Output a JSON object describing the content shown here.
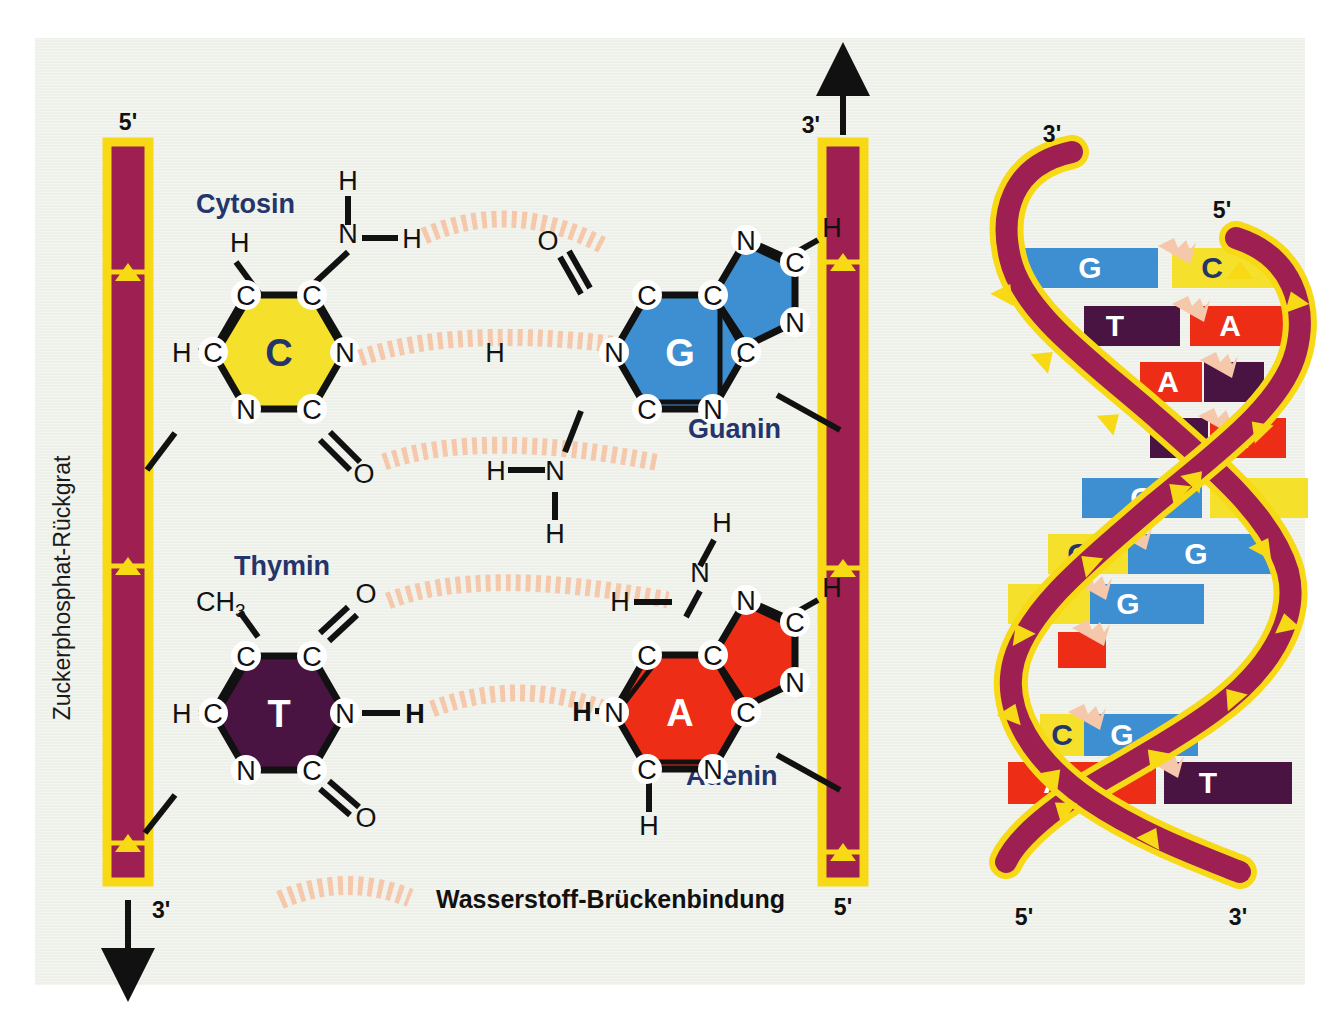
{
  "figure": {
    "title_vertical": "Zuckerphosphat-Rückgrat",
    "legend_label": "Wasserstoff-Brückenbindung"
  },
  "colors": {
    "background": "#eef0ea",
    "backbone_fill": "#9e1f51",
    "backbone_edge": "#f7d915",
    "cytosine": "#f5e12b",
    "guanine": "#3d8fd1",
    "adenine": "#ee2d16",
    "thymine": "#4a1442",
    "hbond": "#f6c8ab",
    "label_blue": "#23356b",
    "bond_black": "#111111"
  },
  "left_diagram": {
    "backbone_left": {
      "top_label": "5'",
      "bottom_label": "3'",
      "arrow_direction": "down"
    },
    "backbone_right": {
      "top_label": "3'",
      "bottom_label": "5'",
      "arrow_direction": "up"
    },
    "pairs": [
      {
        "name": "C-G",
        "left_base": {
          "letter": "C",
          "title": "Cytosin",
          "ring_atoms": [
            "C",
            "C",
            "N",
            "C",
            "N",
            "C"
          ],
          "substituents": [
            "H",
            "H",
            "N",
            "H",
            "H",
            "O"
          ]
        },
        "right_base": {
          "letter": "G",
          "title": "Guanin",
          "ring_atoms": [
            "C",
            "C",
            "C",
            "N",
            "C",
            "N"
          ],
          "five_ring_atoms": [
            "N",
            "C",
            "N",
            "C"
          ],
          "substituents": [
            "O",
            "H",
            "H",
            "N",
            "H",
            "H"
          ]
        },
        "hbonds": 3
      },
      {
        "name": "T-A",
        "left_base": {
          "letter": "T",
          "title": "Thymin",
          "ring_atoms": [
            "C",
            "C",
            "N",
            "C",
            "N",
            "C"
          ],
          "substituents": [
            "CH3",
            "O",
            "H",
            "H",
            "O"
          ]
        },
        "right_base": {
          "letter": "A",
          "title": "Adenin",
          "ring_atoms": [
            "C",
            "C",
            "C",
            "N",
            "C",
            "N"
          ],
          "five_ring_atoms": [
            "N",
            "C",
            "N",
            "C"
          ],
          "substituents": [
            "H",
            "N",
            "H",
            "H"
          ]
        },
        "hbonds": 2
      }
    ],
    "atom_labels": {
      "H": "H",
      "N": "N",
      "O": "O",
      "C": "C",
      "CH3_c": "CH",
      "CH3_sub": "3"
    }
  },
  "helix_diagram": {
    "top_left_label": "3'",
    "top_right_label": "5'",
    "bottom_left_label": "5'",
    "bottom_right_label": "3'",
    "rungs": [
      {
        "left": "G",
        "right": "C"
      },
      {
        "left": "T",
        "right": "A"
      },
      {
        "left": "A",
        "right": "T"
      },
      {
        "left": "T",
        "right": "A"
      },
      {
        "left": "G",
        "right": "C"
      },
      {
        "left": "C",
        "right": "G"
      },
      {
        "left": "C",
        "right": "G"
      },
      {
        "left": "A",
        "right": "T"
      },
      {
        "left": "C",
        "right": "G"
      },
      {
        "left": "A",
        "right": "T"
      }
    ]
  }
}
